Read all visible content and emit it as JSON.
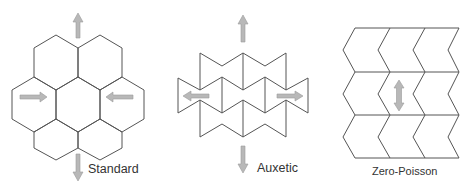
{
  "figure": {
    "panels": [
      {
        "id": "standard",
        "label": "Standard",
        "description": "Hexagonal honeycomb, 7 cells; vertical tension arrows out, horizontal arrows inward (positive Poisson ratio)"
      },
      {
        "id": "auxetic",
        "label": "Auxetic",
        "description": "Re-entrant (bow-tie) honeycomb; vertical tension arrows out, horizontal arrows outward (negative Poisson ratio)"
      },
      {
        "id": "zero_poisson",
        "label": "Zero-Poisson",
        "description": "Chevron/semi-re-entrant cells in 3 rows x 3 columns; vertical double-headed arrow"
      }
    ],
    "colors": {
      "line": "#555555",
      "arrow_fill": "#b8b8b8",
      "text": "#333333",
      "background": "#ffffff"
    }
  }
}
